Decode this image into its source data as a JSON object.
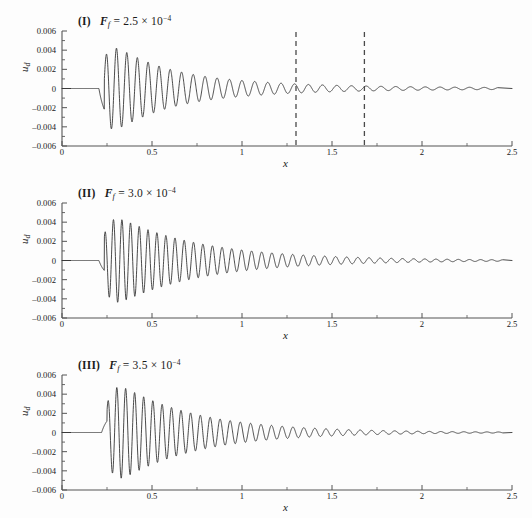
{
  "figure": {
    "background": "#fdfdfd",
    "line_color": "#2a2a2a",
    "axis_color": "#555555",
    "dash_color": "#4a4a4a"
  },
  "chart_data": [
    {
      "type": "line",
      "panel_id": "I",
      "title": "(I)  F_f = 2.5 × 10⁻⁴",
      "title_parts": {
        "label": "(I)",
        "symbol": "F",
        "subscript": "f",
        "equals": "=",
        "value": "2.5",
        "times": "×",
        "base": "10",
        "exponent": "−4"
      },
      "xlabel": "x",
      "ylabel": "u",
      "ylabel_sub": "d",
      "xlim": [
        0,
        2.5
      ],
      "ylim": [
        -0.006,
        0.006
      ],
      "xticks": [
        0,
        0.5,
        1,
        1.5,
        2,
        2.5
      ],
      "xtick_labels": [
        "0",
        "0.5",
        "1",
        "1.5",
        "2",
        "2.5"
      ],
      "yticks": [
        0.006,
        0.004,
        0.002,
        0,
        -0.002,
        -0.004,
        -0.006
      ],
      "ytick_labels": [
        "0.006",
        "0.004",
        "0.002",
        "0",
        "–0.002",
        "–0.004",
        "–0.006"
      ],
      "grid": false,
      "legend": null,
      "annotations": [
        {
          "type": "vline",
          "x": 1.3,
          "style": "dashed"
        },
        {
          "type": "vline",
          "x": 1.68,
          "style": "dashed"
        }
      ],
      "wave": {
        "onset_x": 0.205,
        "start_dip_amp": -0.0042,
        "peak_amp": 0.00465,
        "peak_x": 0.262,
        "growth_end_x": 0.265,
        "decay_rate": 3.05,
        "wavelength_start": 0.055,
        "wavelength_end": 0.082,
        "tail_amp": 0.00035,
        "tail_start_x": 1.05,
        "end_x": 2.42
      }
    },
    {
      "type": "line",
      "panel_id": "II",
      "title": "(II)  F_f = 3.0 × 10⁻⁴",
      "title_parts": {
        "label": "(II)",
        "symbol": "F",
        "subscript": "f",
        "equals": "=",
        "value": "3.0",
        "times": "×",
        "base": "10",
        "exponent": "−4"
      },
      "xlabel": "x",
      "ylabel": "u",
      "ylabel_sub": "d",
      "xlim": [
        0,
        2.5
      ],
      "ylim": [
        -0.006,
        0.006
      ],
      "xticks": [
        0,
        0.5,
        1,
        1.5,
        2,
        2.5
      ],
      "xtick_labels": [
        "0",
        "0.5",
        "1",
        "1.5",
        "2",
        "2.5"
      ],
      "yticks": [
        0.006,
        0.004,
        0.002,
        0,
        -0.002,
        -0.004,
        -0.006
      ],
      "ytick_labels": [
        "0.006",
        "0.004",
        "0.002",
        "0",
        "–0.002",
        "–0.004",
        "–0.006"
      ],
      "grid": false,
      "legend": null,
      "annotations": [],
      "wave": {
        "onset_x": 0.205,
        "start_dip_amp": -0.002,
        "peak_amp": 0.00465,
        "peak_x": 0.295,
        "growth_end_x": 0.3,
        "decay_rate": 2.15,
        "wavelength_start": 0.046,
        "wavelength_end": 0.062,
        "tail_amp": 8e-05,
        "tail_start_x": 1.45,
        "end_x": 2.45
      }
    },
    {
      "type": "line",
      "panel_id": "III",
      "title": "(III)  F_f = 3.5 × 10⁻⁴",
      "title_parts": {
        "label": "(III)",
        "symbol": "F",
        "subscript": "f",
        "equals": "=",
        "value": "3.5",
        "times": "×",
        "base": "10",
        "exponent": "−4"
      },
      "xlabel": "x",
      "ylabel": "u",
      "ylabel_sub": "d",
      "xlim": [
        0,
        2.5
      ],
      "ylim": [
        -0.006,
        0.006
      ],
      "xticks": [
        0,
        0.5,
        1,
        1.5,
        2,
        2.5
      ],
      "xtick_labels": [
        "0",
        "0.5",
        "1",
        "1.5",
        "2",
        "2.5"
      ],
      "yticks": [
        0.006,
        0.004,
        0.002,
        0,
        -0.002,
        -0.004,
        -0.006
      ],
      "ytick_labels": [
        "0.006",
        "0.004",
        "0.002",
        "0",
        "–0.002",
        "–0.004",
        "–0.006"
      ],
      "grid": false,
      "legend": null,
      "annotations": [],
      "wave": {
        "onset_x": 0.22,
        "start_dip_amp": 0.0023,
        "peak_amp": 0.0051,
        "peak_x": 0.315,
        "growth_end_x": 0.32,
        "decay_rate": 2.35,
        "wavelength_start": 0.048,
        "wavelength_end": 0.064,
        "tail_amp": 5e-05,
        "tail_start_x": 1.4,
        "end_x": 2.45
      }
    }
  ],
  "plot_geometry": {
    "left_px": 62,
    "right_px": 512,
    "top_px": 31,
    "bottom_px": 146,
    "zero_px": 88.5,
    "tick_len": 5,
    "minor_tick_len": 3
  }
}
